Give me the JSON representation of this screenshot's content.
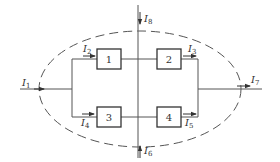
{
  "diagram": {
    "type": "circuit-node-currents",
    "boundary": "dashed ellipse enclosing elements 1-4",
    "elements": [
      {
        "id": "box1",
        "label": "1"
      },
      {
        "id": "box2",
        "label": "2"
      },
      {
        "id": "box3",
        "label": "3"
      },
      {
        "id": "box4",
        "label": "4"
      }
    ],
    "currents": [
      {
        "id": "I1",
        "base": "I",
        "sub": "1",
        "direction": "right (into boundary, left side)"
      },
      {
        "id": "I2",
        "base": "I",
        "sub": "2",
        "direction": "right (into element 1)"
      },
      {
        "id": "I3",
        "base": "I",
        "sub": "3",
        "direction": "right (out of element 2)"
      },
      {
        "id": "I4",
        "base": "I",
        "sub": "4",
        "direction": "right (into element 3)"
      },
      {
        "id": "I5",
        "base": "I",
        "sub": "5",
        "direction": "right (out of element 4)"
      },
      {
        "id": "I6",
        "base": "I",
        "sub": "6",
        "direction": "up (into boundary, bottom)"
      },
      {
        "id": "I7",
        "base": "I",
        "sub": "7",
        "direction": "right (out of boundary, right side)"
      },
      {
        "id": "I8",
        "base": "I",
        "sub": "8",
        "direction": "down (into boundary, top)"
      }
    ]
  }
}
